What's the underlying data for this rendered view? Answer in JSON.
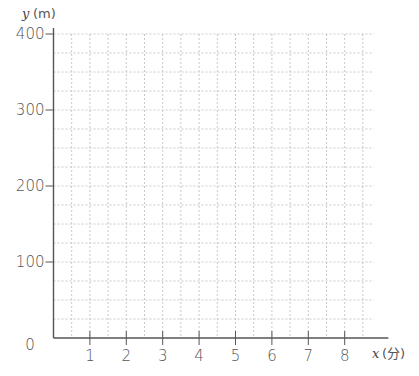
{
  "chart_data": {
    "type": "line",
    "title": "",
    "xlabel": "x",
    "xunit": "(分)",
    "ylabel": "y",
    "yunit": "(m)",
    "xlim": [
      0,
      9.2
    ],
    "ylim": [
      0,
      400
    ],
    "x_ticks": [
      1,
      2,
      3,
      4,
      5,
      6,
      7,
      8
    ],
    "x_tick_labels": [
      "1",
      "2",
      "3",
      "4",
      "5",
      "6",
      "7",
      "8"
    ],
    "y_ticks": [
      100,
      200,
      300,
      400
    ],
    "y_tick_labels": [
      "100",
      "200",
      "300",
      "400"
    ],
    "origin_label": "0",
    "grid": true,
    "grid_x_step": 0.5,
    "grid_y_step": 25,
    "series": []
  },
  "colors": {
    "axis": "#555555",
    "grid": "#c8c8c8",
    "text": "#555555"
  }
}
